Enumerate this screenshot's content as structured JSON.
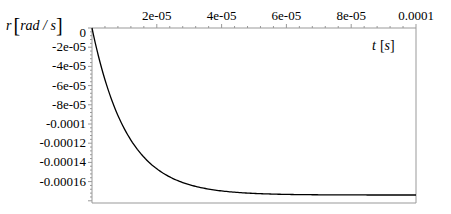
{
  "chart_data": {
    "type": "line",
    "title": "",
    "xlabel": "t [s]",
    "ylabel": "r [rad / s]",
    "xlim": [
      0,
      0.0001
    ],
    "ylim": [
      -0.000182,
      0
    ],
    "grid": false,
    "legend": null,
    "x_ticks": [
      "2e-05",
      "4e-05",
      "6e-05",
      "8e-05",
      "0.0001"
    ],
    "y_ticks": [
      "0",
      "-2e-05",
      "-4e-05",
      "-6e-05",
      "-8e-05",
      "-0.0001",
      "-0.00012",
      "-0.00014",
      "-0.00016"
    ],
    "series": [
      {
        "name": "r(t)",
        "color": "#000000",
        "x": [
          0,
          5e-06,
          1e-05,
          1.5e-05,
          2e-05,
          2.5e-05,
          3e-05,
          4e-05,
          5e-05,
          6e-05,
          7e-05,
          8e-05,
          9e-05,
          0.0001
        ],
        "y": [
          0,
          -5.6e-05,
          -9.45e-05,
          -0.000121,
          -0.000139,
          -0.000151,
          -0.000159,
          -0.000167,
          -0.000171,
          -0.000172,
          -0.0001733,
          -0.0001737,
          -0.0001739,
          -0.000174
        ]
      }
    ]
  },
  "labels": {
    "ylabel_var": "r",
    "ylabel_unit": "rad / s",
    "xlabel_var": "t",
    "xlabel_unit": "s"
  }
}
